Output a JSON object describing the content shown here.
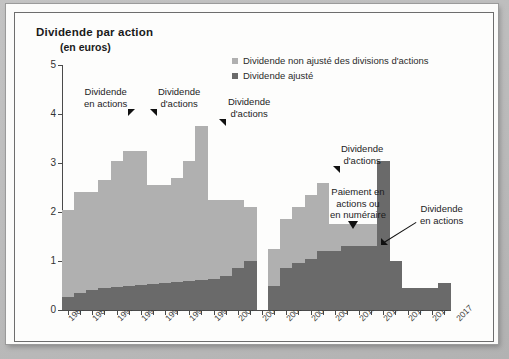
{
  "chart_data": {
    "type": "bar",
    "title": "Dividende par action",
    "subtitle": "(en euros)",
    "xlabel": "",
    "ylabel": "",
    "ylim": [
      0,
      5
    ],
    "yticks": [
      0,
      1,
      2,
      3,
      4,
      5
    ],
    "grid": false,
    "legend_position": "top-right",
    "x": [
      1987,
      1988,
      1989,
      1990,
      1991,
      1992,
      1993,
      1994,
      1995,
      1996,
      1997,
      1998,
      1999,
      2000,
      2001,
      2002,
      2003,
      2004,
      2005,
      2006,
      2007,
      2008,
      2009,
      2010,
      2011,
      2012,
      2013,
      2014,
      2015,
      2016,
      2017,
      2018
    ],
    "xtick_labels": [
      "1987",
      "1989",
      "1991",
      "1993",
      "1995",
      "1997",
      "1999",
      "2001",
      "2003",
      "2005",
      "2007",
      "2009",
      "2011",
      "2011",
      "2013",
      "2015",
      "2017"
    ],
    "series": [
      {
        "name": "Dividende non ajusté des divisions d'actions",
        "color": "#b0b0b0",
        "values": [
          2.05,
          2.4,
          2.4,
          2.65,
          3.05,
          3.25,
          3.25,
          2.55,
          2.55,
          2.7,
          3.05,
          3.75,
          2.25,
          2.25,
          2.25,
          2.1,
          0,
          1.25,
          1.85,
          2.1,
          2.35,
          2.6,
          1.75,
          1.75,
          1.75,
          1.75,
          1.75,
          1.0,
          0.45,
          0.45,
          0.45,
          0.55
        ]
      },
      {
        "name": "Dividende ajusté",
        "color": "#6a6a6a",
        "values": [
          0.27,
          0.35,
          0.4,
          0.44,
          0.47,
          0.5,
          0.52,
          0.53,
          0.55,
          0.57,
          0.6,
          0.62,
          0.64,
          0.7,
          0.85,
          1.0,
          0,
          0.5,
          0.85,
          0.95,
          1.05,
          1.2,
          1.2,
          1.3,
          1.3,
          1.3,
          3.05,
          1.0,
          0.45,
          0.45,
          0.45,
          0.55
        ]
      }
    ],
    "legend": [
      {
        "label": "Dividende non ajusté des divisions d'actions",
        "color": "#b0b0b0"
      },
      {
        "label": "Dividende ajusté",
        "color": "#6a6a6a"
      }
    ],
    "annotations": [
      {
        "id": "a1",
        "text": "Dividende\nen actions",
        "marker": "triangle-down-left"
      },
      {
        "id": "a2",
        "text": "Dividende\nd'actions",
        "marker": "triangle-down-right"
      },
      {
        "id": "a3",
        "text": "Dividende\nd'actions",
        "marker": "triangle-down-right"
      },
      {
        "id": "a4",
        "text": "Dividende\nd'actions",
        "marker": "triangle-down-right"
      },
      {
        "id": "a5",
        "text": "Paiement en\nactions ou\nen numéraire",
        "marker": "triangle-down"
      },
      {
        "id": "a6",
        "text": "Dividende\nen actions",
        "marker": "leader-line"
      }
    ]
  },
  "annotations_text": {
    "a1_l1": "Dividende",
    "a1_l2": "en actions",
    "a2_l1": "Dividende",
    "a2_l2": "d'actions",
    "a3_l1": "Dividende",
    "a3_l2": "d'actions",
    "a4_l1": "Dividende",
    "a4_l2": "d'actions",
    "a5_l1": "Paiement en",
    "a5_l2": "actions ou",
    "a5_l3": "en numéraire",
    "a6_l1": "Dividende",
    "a6_l2": "en actions"
  }
}
